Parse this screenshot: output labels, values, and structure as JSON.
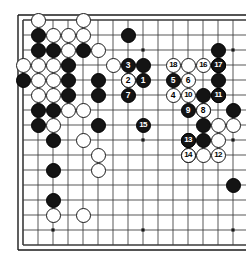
{
  "app": {
    "title": "Go Board Diagram",
    "kind": "go-game-diagram"
  },
  "board": {
    "label": "Go board",
    "visible_columns": 16,
    "visible_rows": 16,
    "grid_spacing_px": 15,
    "origin_x_px": 23,
    "origin_y_px": 20,
    "line_color": "#3a3a3a",
    "border_color": "#1a1a1a",
    "background_color": "#ffffff",
    "black_color": "#141414",
    "white_color": "#ffffff",
    "star_points": [
      {
        "col": 2,
        "row": 2
      },
      {
        "col": 2,
        "row": 8
      },
      {
        "col": 2,
        "row": 14
      },
      {
        "col": 8,
        "row": 2
      },
      {
        "col": 8,
        "row": 8
      },
      {
        "col": 8,
        "row": 14
      },
      {
        "col": 14,
        "row": 2
      },
      {
        "col": 14,
        "row": 8
      },
      {
        "col": 14,
        "row": 14
      }
    ],
    "edges": {
      "top": true,
      "left": true,
      "bottom": true,
      "right": false
    }
  },
  "stones": [
    {
      "col": 1,
      "row": 0,
      "color": "white"
    },
    {
      "col": 4,
      "row": 0,
      "color": "white"
    },
    {
      "col": 1,
      "row": 1,
      "color": "black"
    },
    {
      "col": 2,
      "row": 1,
      "color": "white"
    },
    {
      "col": 3,
      "row": 1,
      "color": "white"
    },
    {
      "col": 4,
      "row": 1,
      "color": "white"
    },
    {
      "col": 7,
      "row": 1,
      "color": "black"
    },
    {
      "col": 1,
      "row": 2,
      "color": "black"
    },
    {
      "col": 2,
      "row": 2,
      "color": "black"
    },
    {
      "col": 3,
      "row": 2,
      "color": "white"
    },
    {
      "col": 4,
      "row": 2,
      "color": "black"
    },
    {
      "col": 5,
      "row": 2,
      "color": "white"
    },
    {
      "col": 13,
      "row": 2,
      "color": "black"
    },
    {
      "col": 0,
      "row": 3,
      "color": "white"
    },
    {
      "col": 1,
      "row": 3,
      "color": "white"
    },
    {
      "col": 2,
      "row": 3,
      "color": "white"
    },
    {
      "col": 3,
      "row": 3,
      "color": "black"
    },
    {
      "col": 6,
      "row": 3,
      "color": "white"
    },
    {
      "col": 8,
      "row": 3,
      "color": "black"
    },
    {
      "col": 11,
      "row": 3,
      "color": "white"
    },
    {
      "col": 13,
      "row": 3,
      "color": "black"
    },
    {
      "col": 0,
      "row": 4,
      "color": "black"
    },
    {
      "col": 1,
      "row": 4,
      "color": "white"
    },
    {
      "col": 2,
      "row": 4,
      "color": "white"
    },
    {
      "col": 3,
      "row": 4,
      "color": "black"
    },
    {
      "col": 5,
      "row": 4,
      "color": "black"
    },
    {
      "col": 7,
      "row": 4,
      "color": "black"
    },
    {
      "col": 13,
      "row": 4,
      "color": "black"
    },
    {
      "col": 1,
      "row": 5,
      "color": "white"
    },
    {
      "col": 2,
      "row": 5,
      "color": "white"
    },
    {
      "col": 3,
      "row": 5,
      "color": "black"
    },
    {
      "col": 5,
      "row": 5,
      "color": "black"
    },
    {
      "col": 12,
      "row": 5,
      "color": "black"
    },
    {
      "col": 13,
      "row": 5,
      "color": "black"
    },
    {
      "col": 1,
      "row": 6,
      "color": "black"
    },
    {
      "col": 2,
      "row": 6,
      "color": "black"
    },
    {
      "col": 3,
      "row": 6,
      "color": "white"
    },
    {
      "col": 4,
      "row": 6,
      "color": "white"
    },
    {
      "col": 12,
      "row": 6,
      "color": "black"
    },
    {
      "col": 14,
      "row": 6,
      "color": "black"
    },
    {
      "col": 1,
      "row": 7,
      "color": "black"
    },
    {
      "col": 2,
      "row": 7,
      "color": "white"
    },
    {
      "col": 5,
      "row": 7,
      "color": "black"
    },
    {
      "col": 12,
      "row": 7,
      "color": "black"
    },
    {
      "col": 13,
      "row": 7,
      "color": "white"
    },
    {
      "col": 14,
      "row": 7,
      "color": "white"
    },
    {
      "col": 2,
      "row": 8,
      "color": "black"
    },
    {
      "col": 4,
      "row": 8,
      "color": "white"
    },
    {
      "col": 11,
      "row": 8,
      "color": "black"
    },
    {
      "col": 12,
      "row": 8,
      "color": "black"
    },
    {
      "col": 13,
      "row": 8,
      "color": "white"
    },
    {
      "col": 5,
      "row": 9,
      "color": "white"
    },
    {
      "col": 11,
      "row": 9,
      "color": "black"
    },
    {
      "col": 12,
      "row": 9,
      "color": "white"
    },
    {
      "col": 2,
      "row": 10,
      "color": "black"
    },
    {
      "col": 5,
      "row": 10,
      "color": "white"
    },
    {
      "col": 2,
      "row": 12,
      "color": "black"
    },
    {
      "col": 2,
      "row": 13,
      "color": "white"
    },
    {
      "col": 4,
      "row": 13,
      "color": "white"
    },
    {
      "col": 14,
      "row": 11,
      "color": "black"
    }
  ],
  "move_stones": [
    {
      "num": "1",
      "col": 8,
      "row": 4,
      "color": "black"
    },
    {
      "num": "2",
      "col": 7,
      "row": 4,
      "color": "white"
    },
    {
      "num": "3",
      "col": 7,
      "row": 3,
      "color": "black"
    },
    {
      "num": "4",
      "col": 10,
      "row": 5,
      "color": "white"
    },
    {
      "num": "5",
      "col": 10,
      "row": 4,
      "color": "black"
    },
    {
      "num": "6",
      "col": 11,
      "row": 4,
      "color": "white"
    },
    {
      "num": "7",
      "col": 7,
      "row": 5,
      "color": "black"
    },
    {
      "num": "8",
      "col": 12,
      "row": 6,
      "color": "white"
    },
    {
      "num": "9",
      "col": 11,
      "row": 6,
      "color": "black"
    },
    {
      "num": "10",
      "col": 11,
      "row": 5,
      "color": "white"
    },
    {
      "num": "11",
      "col": 13,
      "row": 5,
      "color": "black"
    },
    {
      "num": "12",
      "col": 13,
      "row": 9,
      "color": "white"
    },
    {
      "num": "13",
      "col": 11,
      "row": 8,
      "color": "black"
    },
    {
      "num": "14",
      "col": 11,
      "row": 9,
      "color": "white"
    },
    {
      "num": "15",
      "col": 8,
      "row": 7,
      "color": "black"
    },
    {
      "num": "16",
      "col": 12,
      "row": 3,
      "color": "white"
    },
    {
      "num": "17",
      "col": 13,
      "row": 3,
      "color": "black"
    },
    {
      "num": "18",
      "col": 10,
      "row": 3,
      "color": "white"
    }
  ]
}
